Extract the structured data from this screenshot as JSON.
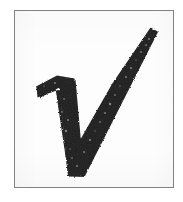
{
  "image": {
    "kind": "scanned-drawing",
    "subject": "handwritten-check-mark",
    "caption_text": "",
    "width_px": 183,
    "height_px": 202,
    "background_color": "#ffffff"
  },
  "frame": {
    "name": "thin rectangular border",
    "color": "#7c7c7c",
    "fill_color": "#fdfdfd",
    "stroke_width_px": 1,
    "left_px": 14,
    "top_px": 10,
    "width_px": 160,
    "height_px": 178
  },
  "mark": {
    "glyph_name": "check-mark",
    "unicode": "✓",
    "ink_color": "#1c1c1c",
    "ink_color_light": "#333333",
    "style": "hand-drawn thick marker stroke with serif hook at upper left",
    "stroke_texture": "rough / speckled toner",
    "points": {
      "hook_left_tip": [
        36,
        87
      ],
      "hook_top": [
        58,
        76
      ],
      "shoulder": [
        73,
        80
      ],
      "bottom_vertex": [
        74,
        176
      ],
      "top_right_tip": [
        157,
        28
      ]
    },
    "stroke_width_px": {
      "descending": 15,
      "ascending": 17,
      "hook": 11
    }
  },
  "speckles": [
    {
      "x": 48,
      "y": 94,
      "r": 1.1,
      "o": 0.45
    },
    {
      "x": 62,
      "y": 112,
      "r": 0.9,
      "o": 0.38
    },
    {
      "x": 66,
      "y": 131,
      "r": 1.2,
      "o": 0.42
    },
    {
      "x": 70,
      "y": 149,
      "r": 0.8,
      "o": 0.35
    },
    {
      "x": 77,
      "y": 166,
      "r": 1.0,
      "o": 0.4
    },
    {
      "x": 90,
      "y": 140,
      "r": 1.1,
      "o": 0.44
    },
    {
      "x": 100,
      "y": 122,
      "r": 0.9,
      "o": 0.36
    },
    {
      "x": 110,
      "y": 104,
      "r": 1.2,
      "o": 0.46
    },
    {
      "x": 120,
      "y": 86,
      "r": 0.8,
      "o": 0.34
    },
    {
      "x": 131,
      "y": 68,
      "r": 1.1,
      "o": 0.42
    },
    {
      "x": 141,
      "y": 52,
      "r": 0.9,
      "o": 0.37
    },
    {
      "x": 149,
      "y": 39,
      "r": 1.0,
      "o": 0.4
    },
    {
      "x": 44,
      "y": 86,
      "r": 0.8,
      "o": 0.33
    },
    {
      "x": 55,
      "y": 83,
      "r": 1.0,
      "o": 0.39
    },
    {
      "x": 64,
      "y": 99,
      "r": 0.9,
      "o": 0.36
    },
    {
      "x": 68,
      "y": 120,
      "r": 1.0,
      "o": 0.41
    },
    {
      "x": 72,
      "y": 158,
      "r": 0.9,
      "o": 0.35
    },
    {
      "x": 84,
      "y": 152,
      "r": 1.0,
      "o": 0.4
    },
    {
      "x": 95,
      "y": 131,
      "r": 0.8,
      "o": 0.33
    },
    {
      "x": 105,
      "y": 113,
      "r": 1.0,
      "o": 0.39
    },
    {
      "x": 115,
      "y": 95,
      "r": 0.9,
      "o": 0.36
    },
    {
      "x": 126,
      "y": 77,
      "r": 1.0,
      "o": 0.41
    },
    {
      "x": 136,
      "y": 60,
      "r": 0.8,
      "o": 0.34
    },
    {
      "x": 146,
      "y": 45,
      "r": 0.9,
      "o": 0.38
    }
  ]
}
